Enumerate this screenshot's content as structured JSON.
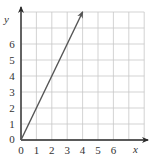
{
  "chart_data": {
    "type": "line",
    "title": "",
    "xlabel": "x",
    "ylabel": "y",
    "xlim": [
      0,
      8
    ],
    "ylim": [
      0,
      8
    ],
    "grid": true,
    "x_ticks": [
      "0",
      "1",
      "2",
      "3",
      "4",
      "5",
      "6"
    ],
    "y_ticks": [
      "0",
      "1",
      "2",
      "3",
      "4",
      "5",
      "6"
    ],
    "series": [
      {
        "name": "y = 2x",
        "x": [
          0,
          4
        ],
        "y": [
          0,
          8
        ],
        "arrow_end": true
      }
    ]
  },
  "colors": {
    "grid": "#c8c8c8",
    "axis": "#2a2a2a",
    "line": "#555555"
  }
}
